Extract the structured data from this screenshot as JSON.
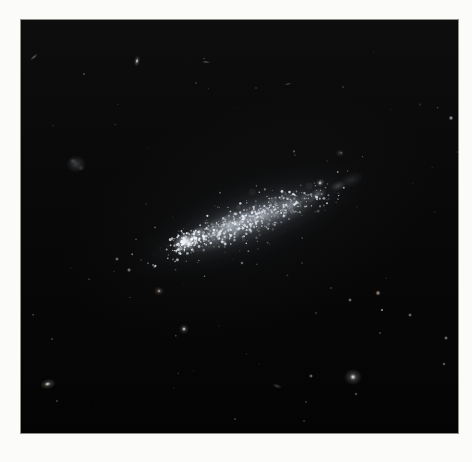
{
  "scene": {
    "description": "Astronomical photograph of an elongated irregular dwarf galaxy, tilted lower-left to upper-right, with a bright star-forming knot at its lower-left end and a granular speckled body, on a dark sky sprinkled with faint field stars and small background galaxies, printed with a white margin.",
    "page_background": "#fbfbf9",
    "frame": {
      "left": 21,
      "top": 20,
      "width": 437,
      "height": 413,
      "border_color": "#8d8d88",
      "sky_top": "#0d0d0d",
      "sky_mid": "#090909",
      "sky_bottom": "#040404"
    },
    "galaxy": {
      "name": "irregular-galaxy",
      "center_x": 227,
      "center_y": 201,
      "angle_deg": -21,
      "major_px": 210,
      "minor_px": 56,
      "bright_knot": {
        "x": 165,
        "y": 222
      },
      "body_tint": "#aeb6c2",
      "knot_tint": "#f2f4f6"
    },
    "blobs": [
      {
        "name": "galaxy-ambient-glow",
        "x": 227,
        "y": 201,
        "rx": 195,
        "ry": 115,
        "angle": -21,
        "rgb": "85,95,110",
        "a": 0.1
      },
      {
        "name": "galaxy-halo",
        "x": 227,
        "y": 201,
        "rx": 130,
        "ry": 40,
        "angle": -21,
        "rgb": "130,140,155",
        "a": 0.15
      },
      {
        "name": "galaxy-body",
        "x": 227,
        "y": 201,
        "rx": 105,
        "ry": 28,
        "angle": -21,
        "rgb": "160,170,183",
        "a": 0.2
      },
      {
        "name": "galaxy-midbody",
        "x": 224,
        "y": 202,
        "rx": 86,
        "ry": 20,
        "angle": -21,
        "rgb": "185,193,205",
        "a": 0.26
      },
      {
        "name": "galaxy-ridge",
        "x": 225,
        "y": 200,
        "rx": 66,
        "ry": 13,
        "angle": -21,
        "rgb": "205,212,222",
        "a": 0.3
      },
      {
        "name": "galaxy-left-bright",
        "x": 198,
        "y": 213,
        "rx": 42,
        "ry": 15,
        "angle": -21,
        "rgb": "195,205,215",
        "a": 0.28
      },
      {
        "name": "galaxy-right-patch",
        "x": 255,
        "y": 193,
        "rx": 48,
        "ry": 13,
        "angle": -21,
        "rgb": "190,200,212",
        "a": 0.22
      },
      {
        "name": "starforming-knot",
        "x": 165,
        "y": 222,
        "rx": 14,
        "ry": 10,
        "angle": -21,
        "rgb": "235,240,246",
        "a": 0.85
      },
      {
        "name": "starforming-knot-core",
        "x": 164,
        "y": 221,
        "rx": 6,
        "ry": 5,
        "angle": -21,
        "rgb": "250,252,254",
        "a": 0.95
      },
      {
        "name": "knot-secondary",
        "x": 177,
        "y": 213,
        "rx": 8,
        "ry": 6,
        "angle": -21,
        "rgb": "225,232,240",
        "a": 0.5
      },
      {
        "name": "body-patch-1",
        "x": 211,
        "y": 206,
        "rx": 10,
        "ry": 7,
        "angle": -21,
        "rgb": "210,218,228",
        "a": 0.35
      },
      {
        "name": "body-patch-2",
        "x": 241,
        "y": 195,
        "rx": 11,
        "ry": 7,
        "angle": -21,
        "rgb": "210,218,228",
        "a": 0.33
      },
      {
        "name": "body-patch-3",
        "x": 271,
        "y": 184,
        "rx": 10,
        "ry": 6,
        "angle": -21,
        "rgb": "212,220,230",
        "a": 0.33
      },
      {
        "name": "body-patch-4",
        "x": 297,
        "y": 174,
        "rx": 9,
        "ry": 6,
        "angle": -21,
        "rgb": "214,222,232",
        "a": 0.3
      },
      {
        "name": "body-patch-5",
        "x": 317,
        "y": 166,
        "rx": 8,
        "ry": 5,
        "angle": -21,
        "rgb": "205,214,226",
        "a": 0.25
      },
      {
        "name": "galaxy-tail",
        "x": 330,
        "y": 160,
        "rx": 14,
        "ry": 7,
        "angle": -21,
        "rgb": "170,180,195",
        "a": 0.15
      },
      {
        "name": "edge-on-galaxy",
        "x": 13,
        "y": 37,
        "rx": 5,
        "ry": 1.6,
        "angle": -40,
        "rgb": "195,200,210",
        "a": 0.5
      },
      {
        "name": "faint-star",
        "x": 63,
        "y": 54,
        "rx": 1.6,
        "ry": 1.6,
        "angle": 0,
        "rgb": "210,215,222",
        "a": 0.5
      },
      {
        "name": "small-galaxy-halo",
        "x": 116,
        "y": 41,
        "rx": 3,
        "ry": 5.5,
        "angle": 10,
        "rgb": "200,206,216",
        "a": 0.5
      },
      {
        "name": "small-galaxy-core",
        "x": 116,
        "y": 41,
        "rx": 1.6,
        "ry": 2.2,
        "angle": 10,
        "rgb": "245,248,252",
        "a": 0.9
      },
      {
        "name": "streak-galaxy",
        "x": 185,
        "y": 42,
        "rx": 4.5,
        "ry": 1.5,
        "angle": 8,
        "rgb": "185,190,200",
        "a": 0.45
      },
      {
        "name": "faint-star",
        "x": 175,
        "y": 63,
        "rx": 1.4,
        "ry": 1.4,
        "angle": 0,
        "rgb": "200,205,215",
        "a": 0.4
      },
      {
        "name": "diffuse-dwarf-galaxy",
        "x": 55,
        "y": 144,
        "rx": 10,
        "ry": 8.5,
        "angle": 0,
        "rgb": "140,145,152",
        "a": 0.38
      },
      {
        "name": "dwarf-mottle",
        "x": 52,
        "y": 141,
        "rx": 4,
        "ry": 3,
        "angle": 0,
        "rgb": "165,170,176",
        "a": 0.3
      },
      {
        "name": "dwarf-mottle",
        "x": 60,
        "y": 148,
        "rx": 3.5,
        "ry": 3,
        "angle": 0,
        "rgb": "160,165,172",
        "a": 0.25
      },
      {
        "name": "streak-galaxy",
        "x": 267,
        "y": 64,
        "rx": 4,
        "ry": 1.3,
        "angle": -12,
        "rgb": "175,180,190",
        "a": 0.4
      },
      {
        "name": "faint-star",
        "x": 235,
        "y": 68,
        "rx": 1.3,
        "ry": 1.3,
        "angle": 0,
        "rgb": "195,200,210",
        "a": 0.35
      },
      {
        "name": "faint-star",
        "x": 322,
        "y": 67,
        "rx": 1.4,
        "ry": 1.4,
        "angle": 0,
        "rgb": "200,205,215",
        "a": 0.4
      },
      {
        "name": "field-star",
        "x": 430,
        "y": 98,
        "rx": 2.4,
        "ry": 2.4,
        "angle": 0,
        "rgb": "235,240,246",
        "a": 0.85
      },
      {
        "name": "faint-fuzzy-galaxy",
        "x": 319,
        "y": 133,
        "rx": 4.5,
        "ry": 3.8,
        "angle": 0,
        "rgb": "150,155,165",
        "a": 0.3
      },
      {
        "name": "faint-star",
        "x": 274,
        "y": 135,
        "rx": 1.4,
        "ry": 1.4,
        "angle": 0,
        "rgb": "190,196,206",
        "a": 0.35
      },
      {
        "name": "faint-star",
        "x": 306,
        "y": 141,
        "rx": 1.2,
        "ry": 1.2,
        "angle": 0,
        "rgb": "185,190,200",
        "a": 0.3
      },
      {
        "name": "star-halo",
        "x": 299,
        "y": 163,
        "rx": 4.5,
        "ry": 4.5,
        "angle": 0,
        "rgb": "180,188,200",
        "a": 0.35
      },
      {
        "name": "field-star",
        "x": 299,
        "y": 163,
        "rx": 2,
        "ry": 2,
        "angle": 0,
        "rgb": "245,248,252",
        "a": 0.95
      },
      {
        "name": "field-star",
        "x": 221,
        "y": 243,
        "rx": 1.8,
        "ry": 1.8,
        "angle": 0,
        "rgb": "230,234,240",
        "a": 0.75
      },
      {
        "name": "field-star",
        "x": 96,
        "y": 239,
        "rx": 2,
        "ry": 2,
        "angle": 0,
        "rgb": "225,230,238",
        "a": 0.7
      },
      {
        "name": "field-star",
        "x": 108,
        "y": 250,
        "rx": 2.2,
        "ry": 2.2,
        "angle": 0,
        "rgb": "230,225,215",
        "a": 0.75
      },
      {
        "name": "fuzzy-galaxy-halo",
        "x": 138,
        "y": 271,
        "rx": 5,
        "ry": 4.4,
        "angle": 0,
        "rgb": "170,150,132",
        "a": 0.45
      },
      {
        "name": "fuzzy-galaxy-core",
        "x": 138,
        "y": 271,
        "rx": 1.8,
        "ry": 1.8,
        "angle": 0,
        "rgb": "235,220,205",
        "a": 0.8
      },
      {
        "name": "star-halo",
        "x": 163,
        "y": 309,
        "rx": 5,
        "ry": 5,
        "angle": 0,
        "rgb": "185,175,165",
        "a": 0.4
      },
      {
        "name": "field-star",
        "x": 163,
        "y": 309,
        "rx": 2.2,
        "ry": 2.2,
        "angle": 0,
        "rgb": "248,244,238",
        "a": 0.95
      },
      {
        "name": "faint-star",
        "x": 31,
        "y": 319,
        "rx": 1.5,
        "ry": 1.5,
        "angle": 0,
        "rgb": "205,210,218",
        "a": 0.5
      },
      {
        "name": "elliptical-galaxy-halo",
        "x": 27,
        "y": 364,
        "rx": 8,
        "ry": 5,
        "angle": -12,
        "rgb": "185,172,158",
        "a": 0.5
      },
      {
        "name": "elliptical-galaxy-core",
        "x": 26.5,
        "y": 364,
        "rx": 3,
        "ry": 2,
        "angle": -12,
        "rgb": "255,245,232",
        "a": 0.95
      },
      {
        "name": "faint-star",
        "x": 36,
        "y": 381,
        "rx": 1.6,
        "ry": 1.6,
        "angle": 0,
        "rgb": "200,195,188",
        "a": 0.5
      },
      {
        "name": "warm-field-star",
        "x": 357,
        "y": 273,
        "rx": 2.8,
        "ry": 2.8,
        "angle": 0,
        "rgb": "232,205,178",
        "a": 0.85
      },
      {
        "name": "field-star",
        "x": 329,
        "y": 280,
        "rx": 2,
        "ry": 2,
        "angle": 0,
        "rgb": "228,232,240",
        "a": 0.7
      },
      {
        "name": "faint-star",
        "x": 310,
        "y": 268,
        "rx": 1.4,
        "ry": 1.4,
        "angle": 0,
        "rgb": "205,210,218",
        "a": 0.45
      },
      {
        "name": "faint-star",
        "x": 281,
        "y": 243,
        "rx": 1.3,
        "ry": 1.3,
        "angle": 0,
        "rgb": "200,206,214",
        "a": 0.4
      },
      {
        "name": "white-point-star",
        "x": 361,
        "y": 290,
        "rx": 1.6,
        "ry": 1.6,
        "angle": 0,
        "rgb": "252,252,255",
        "a": 0.95
      },
      {
        "name": "field-star",
        "x": 389,
        "y": 295,
        "rx": 2,
        "ry": 2,
        "angle": 0,
        "rgb": "225,230,238",
        "a": 0.7
      },
      {
        "name": "faint-star",
        "x": 295,
        "y": 293,
        "rx": 1.4,
        "ry": 1.4,
        "angle": 0,
        "rgb": "200,206,214",
        "a": 0.45
      },
      {
        "name": "faint-star",
        "x": 359,
        "y": 313,
        "rx": 1.5,
        "ry": 1.5,
        "angle": 0,
        "rgb": "205,210,218",
        "a": 0.5
      },
      {
        "name": "field-star",
        "x": 425,
        "y": 318,
        "rx": 2,
        "ry": 2,
        "angle": 0,
        "rgb": "228,232,240",
        "a": 0.75
      },
      {
        "name": "field-star",
        "x": 423,
        "y": 344,
        "rx": 1.8,
        "ry": 1.8,
        "angle": 0,
        "rgb": "220,225,232",
        "a": 0.65
      },
      {
        "name": "round-galaxy-halo",
        "x": 332,
        "y": 357,
        "rx": 9,
        "ry": 8,
        "angle": 0,
        "rgb": "175,175,178",
        "a": 0.5
      },
      {
        "name": "round-galaxy-core",
        "x": 332,
        "y": 357,
        "rx": 3,
        "ry": 3,
        "angle": 0,
        "rgb": "250,250,250",
        "a": 0.95
      },
      {
        "name": "field-star",
        "x": 290,
        "y": 356,
        "rx": 2,
        "ry": 2,
        "angle": 0,
        "rgb": "225,230,236",
        "a": 0.7
      },
      {
        "name": "streak-galaxy",
        "x": 256,
        "y": 366,
        "rx": 5,
        "ry": 2.2,
        "angle": 18,
        "rgb": "160,158,155",
        "a": 0.4
      },
      {
        "name": "faint-star",
        "x": 335,
        "y": 374,
        "rx": 1.7,
        "ry": 1.7,
        "angle": 0,
        "rgb": "215,218,224",
        "a": 0.6
      },
      {
        "name": "faint-star",
        "x": 285,
        "y": 382,
        "rx": 1.4,
        "ry": 1.4,
        "angle": 0,
        "rgb": "200,205,212",
        "a": 0.45
      },
      {
        "name": "faint-star",
        "x": 283,
        "y": 401,
        "rx": 1.4,
        "ry": 1.4,
        "angle": 0,
        "rgb": "198,202,210",
        "a": 0.45
      }
    ],
    "speckles": {
      "seed": 7,
      "groups": [
        {
          "name": "unresolved-patches",
          "x": 227,
          "y": 201,
          "angle": -21,
          "sx": 60,
          "sy": 12,
          "count": 70,
          "rmin": 1.8,
          "rmax": 3.6,
          "amin": 0.04,
          "amax": 0.14,
          "rgb": "200,210,225"
        },
        {
          "name": "body-stars",
          "x": 227,
          "y": 201,
          "angle": -21,
          "sx": 72,
          "sy": 13,
          "count": 430,
          "rmin": 0.5,
          "rmax": 1.4,
          "amin": 0.15,
          "amax": 0.9,
          "rgb": "235,240,248"
        },
        {
          "name": "outskirt-stars",
          "x": 227,
          "y": 201,
          "angle": -21,
          "sx": 105,
          "sy": 26,
          "count": 150,
          "rmin": 0.4,
          "rmax": 1.1,
          "amin": 0.1,
          "amax": 0.5,
          "rgb": "220,228,240"
        },
        {
          "name": "knot-cluster-stars",
          "x": 168,
          "y": 221,
          "angle": -21,
          "sx": 16,
          "sy": 9,
          "count": 110,
          "rmin": 0.5,
          "rmax": 1.6,
          "amin": 0.3,
          "amax": 1.0,
          "rgb": "245,248,252"
        },
        {
          "name": "sky-noise-stars",
          "x": 218.5,
          "y": 206.5,
          "angle": 0,
          "sx": 218.5,
          "sy": 206.5,
          "uniform": true,
          "count": 40,
          "rmin": 0.4,
          "rmax": 1.0,
          "amin": 0.08,
          "amax": 0.3,
          "rgb": "220,225,235"
        }
      ]
    }
  }
}
